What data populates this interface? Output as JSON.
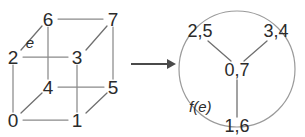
{
  "figure": {
    "type": "graph-mapping-diagram",
    "left_graph": {
      "name": "cube-graph",
      "shape": "cube",
      "vertices": [
        {
          "id": "0",
          "label": "0",
          "x": 13,
          "y": 120
        },
        {
          "id": "1",
          "label": "1",
          "x": 77,
          "y": 120
        },
        {
          "id": "2",
          "label": "2",
          "x": 13,
          "y": 57
        },
        {
          "id": "3",
          "label": "3",
          "x": 77,
          "y": 57
        },
        {
          "id": "4",
          "label": "4",
          "x": 48,
          "y": 87
        },
        {
          "id": "5",
          "label": "5",
          "x": 113,
          "y": 87
        },
        {
          "id": "6",
          "label": "6",
          "x": 48,
          "y": 19
        },
        {
          "id": "7",
          "label": "7",
          "x": 113,
          "y": 19
        }
      ],
      "edges": [
        {
          "from": "6",
          "to": "7"
        },
        {
          "from": "2",
          "to": "3"
        },
        {
          "from": "4",
          "to": "5"
        },
        {
          "from": "0",
          "to": "1"
        },
        {
          "from": "2",
          "to": "6"
        },
        {
          "from": "3",
          "to": "7"
        },
        {
          "from": "0",
          "to": "4"
        },
        {
          "from": "1",
          "to": "5"
        },
        {
          "from": "6",
          "to": "4"
        },
        {
          "from": "7",
          "to": "5"
        },
        {
          "from": "2",
          "to": "0"
        },
        {
          "from": "3",
          "to": "1"
        }
      ],
      "edge_label": {
        "text": "e",
        "edge": "2-6",
        "x": 30,
        "y": 42
      }
    },
    "arrow": {
      "name": "maps-to-arrow",
      "x1": 131,
      "y1": 64,
      "x2": 175,
      "y2": 64,
      "direction": "right"
    },
    "right_graph": {
      "name": "quotient-graph",
      "circle": {
        "cx": 237,
        "cy": 69,
        "r": 58
      },
      "nodes": [
        {
          "id": "2,5",
          "label": "2,5",
          "x": 200,
          "y": 31,
          "role": "outer-top-left"
        },
        {
          "id": "3,4",
          "label": "3,4",
          "x": 276,
          "y": 31,
          "role": "outer-top-right"
        },
        {
          "id": "0,7",
          "label": "0,7",
          "x": 237,
          "y": 70,
          "role": "center"
        },
        {
          "id": "1,6",
          "label": "1,6",
          "x": 237,
          "y": 126,
          "role": "outer-bottom"
        }
      ],
      "edges": [
        {
          "from": "2,5",
          "to": "0,7"
        },
        {
          "from": "3,4",
          "to": "0,7"
        },
        {
          "from": "0,7",
          "to": "1,6"
        }
      ],
      "edge_label": {
        "text": "f(e)",
        "x": 189,
        "y": 106
      }
    },
    "colors": {
      "text": "#2b2b2b",
      "edge": "#8a8a8a",
      "circle": "#9a9a9a",
      "arrow": "#4a4a4a",
      "background": "#ffffff"
    }
  }
}
